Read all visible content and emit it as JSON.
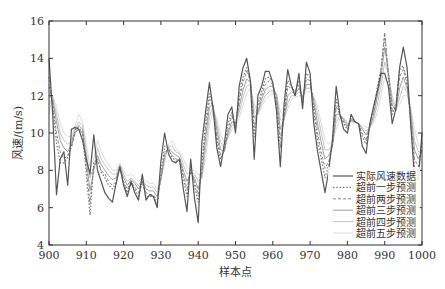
{
  "chart_data": {
    "type": "line",
    "title": "",
    "xlabel": "样本点",
    "ylabel": "风速/(m/s)",
    "xlim": [
      900,
      1000
    ],
    "ylim": [
      4,
      16
    ],
    "xticks": [
      900,
      910,
      920,
      930,
      940,
      950,
      960,
      970,
      980,
      990,
      1000
    ],
    "yticks": [
      4,
      6,
      8,
      10,
      12,
      14,
      16
    ],
    "grid": false,
    "legend_position": "lower right",
    "x": [
      900,
      901,
      902,
      903,
      904,
      905,
      906,
      907,
      908,
      909,
      910,
      911,
      912,
      913,
      914,
      915,
      916,
      917,
      918,
      919,
      920,
      921,
      922,
      923,
      924,
      925,
      926,
      927,
      928,
      929,
      930,
      931,
      932,
      933,
      934,
      935,
      936,
      937,
      938,
      939,
      940,
      941,
      942,
      943,
      944,
      945,
      946,
      947,
      948,
      949,
      950,
      951,
      952,
      953,
      954,
      955,
      956,
      957,
      958,
      959,
      960,
      961,
      962,
      963,
      964,
      965,
      966,
      967,
      968,
      969,
      970,
      971,
      972,
      973,
      974,
      975,
      976,
      977,
      978,
      979,
      980,
      981,
      982,
      983,
      984,
      985,
      986,
      987,
      988,
      989,
      990,
      991,
      992,
      993,
      994,
      995,
      996,
      997,
      998,
      999,
      1000
    ],
    "series": [
      {
        "name": "实际风速数据",
        "style": "solid",
        "color": "#555555",
        "width": 1.2,
        "values": [
          14.0,
          11.0,
          6.7,
          8.6,
          9.0,
          7.2,
          10.2,
          10.3,
          10.2,
          9.6,
          8.6,
          7.8,
          9.9,
          8.0,
          7.4,
          6.8,
          6.5,
          6.3,
          7.3,
          8.2,
          7.2,
          6.6,
          7.4,
          6.8,
          6.4,
          7.8,
          6.4,
          6.7,
          6.6,
          6.0,
          8.5,
          10.0,
          8.9,
          8.5,
          8.4,
          8.6,
          7.0,
          5.8,
          8.6,
          6.5,
          5.2,
          9.5,
          11.2,
          12.7,
          11.3,
          9.2,
          8.2,
          9.4,
          11.0,
          11.4,
          10.0,
          12.5,
          13.5,
          14.0,
          12.8,
          8.6,
          12.0,
          12.5,
          13.3,
          13.3,
          12.7,
          11.2,
          8.2,
          11.5,
          13.4,
          12.5,
          12.0,
          13.2,
          11.3,
          13.8,
          13.2,
          10.5,
          9.0,
          7.9,
          6.8,
          8.0,
          9.7,
          12.5,
          11.0,
          10.2,
          10.0,
          11.0,
          10.6,
          10.5,
          9.3,
          8.9,
          10.5,
          11.4,
          12.2,
          13.2,
          13.2,
          12.5,
          10.5,
          11.3,
          13.5,
          14.6,
          13.5,
          10.4,
          7.6,
          7.5,
          10.0
        ]
      },
      {
        "name": "超前一步预测",
        "style": "dotted",
        "color": "#777777",
        "width": 1.2,
        "values": [
          13.0,
          11.5,
          9.5,
          8.4,
          8.4,
          8.7,
          9.3,
          10.2,
          10.3,
          10.0,
          7.8,
          5.6,
          8.4,
          8.6,
          7.9,
          7.6,
          7.2,
          7.0,
          7.3,
          8.2,
          7.3,
          6.8,
          7.3,
          7.0,
          6.6,
          7.4,
          6.6,
          6.6,
          6.6,
          6.2,
          7.8,
          9.3,
          9.2,
          8.7,
          8.5,
          8.5,
          7.6,
          6.6,
          8.2,
          7.2,
          6.3,
          8.4,
          10.6,
          12.1,
          11.4,
          9.6,
          8.6,
          9.1,
          10.5,
          11.1,
          10.3,
          12.0,
          13.0,
          13.5,
          12.8,
          9.8,
          11.5,
          12.2,
          12.9,
          13.0,
          12.7,
          11.6,
          9.2,
          11.0,
          12.8,
          12.5,
          12.2,
          12.8,
          11.6,
          13.2,
          13.0,
          11.2,
          9.6,
          8.6,
          7.6,
          8.3,
          9.4,
          11.8,
          11.0,
          10.5,
          10.2,
          10.8,
          10.6,
          10.5,
          9.8,
          9.4,
          10.4,
          11.3,
          12.4,
          13.4,
          15.2,
          13.0,
          11.0,
          11.5,
          13.4,
          13.6,
          12.8,
          10.5,
          8.2,
          7.9,
          9.5
        ]
      },
      {
        "name": "超前两步预测",
        "style": "dashed",
        "color": "#888888",
        "width": 1.0,
        "values": [
          12.5,
          11.6,
          10.0,
          9.0,
          8.6,
          8.8,
          9.2,
          10.0,
          10.2,
          10.0,
          8.2,
          6.2,
          8.2,
          8.5,
          8.0,
          7.8,
          7.4,
          7.2,
          7.4,
          8.1,
          7.4,
          7.0,
          7.4,
          7.1,
          6.8,
          7.3,
          6.8,
          6.7,
          6.7,
          6.4,
          7.6,
          9.0,
          9.1,
          8.8,
          8.6,
          8.6,
          7.8,
          7.0,
          8.0,
          7.4,
          6.7,
          8.0,
          10.2,
          11.8,
          11.4,
          9.8,
          8.8,
          9.0,
          10.2,
          10.9,
          10.4,
          11.7,
          12.7,
          13.3,
          12.8,
          10.3,
          11.3,
          12.0,
          12.6,
          12.8,
          12.6,
          11.8,
          9.7,
          10.8,
          12.5,
          12.4,
          12.2,
          12.6,
          11.8,
          12.9,
          12.8,
          11.5,
          10.0,
          9.0,
          8.1,
          8.5,
          9.3,
          11.4,
          11.0,
          10.6,
          10.3,
          10.7,
          10.6,
          10.5,
          10.0,
          9.6,
          10.3,
          11.1,
          12.2,
          13.4,
          15.4,
          13.2,
          11.2,
          11.3,
          13.0,
          13.4,
          12.6,
          10.7,
          8.6,
          8.2,
          9.2
        ]
      },
      {
        "name": "超前三步预测",
        "style": "solid",
        "color": "#a0a0a0",
        "width": 1.0,
        "values": [
          12.0,
          11.8,
          10.6,
          9.6,
          9.2,
          9.0,
          9.4,
          10.0,
          10.4,
          10.2,
          8.6,
          6.9,
          8.0,
          8.8,
          8.3,
          8.0,
          7.7,
          7.5,
          7.6,
          8.2,
          7.6,
          7.2,
          7.5,
          7.3,
          7.0,
          7.4,
          7.0,
          6.9,
          6.9,
          6.6,
          7.5,
          8.8,
          9.2,
          9.0,
          8.8,
          8.7,
          8.0,
          7.4,
          7.9,
          7.6,
          7.0,
          7.8,
          9.8,
          11.4,
          11.5,
          10.2,
          9.1,
          9.0,
          10.0,
          10.6,
          10.5,
          11.4,
          12.3,
          12.9,
          12.7,
          10.8,
          11.1,
          11.8,
          12.3,
          12.5,
          12.5,
          12.0,
          10.2,
          10.7,
          12.0,
          12.2,
          12.1,
          12.4,
          11.9,
          12.6,
          12.6,
          11.7,
          10.5,
          9.5,
          8.6,
          8.8,
          9.3,
          11.0,
          11.0,
          10.7,
          10.4,
          10.7,
          10.6,
          10.5,
          10.2,
          9.9,
          10.3,
          10.9,
          11.9,
          13.0,
          14.6,
          13.3,
          11.5,
          11.2,
          12.4,
          13.0,
          12.4,
          11.0,
          9.1,
          8.6,
          9.0
        ]
      },
      {
        "name": "超前四步预测",
        "style": "solid",
        "color": "#c4c4c4",
        "width": 1.0,
        "values": [
          11.5,
          11.9,
          11.0,
          10.0,
          9.6,
          9.4,
          9.6,
          10.2,
          10.6,
          10.4,
          9.0,
          7.6,
          8.2,
          9.2,
          8.6,
          8.3,
          8.0,
          7.8,
          7.8,
          8.3,
          7.8,
          7.4,
          7.6,
          7.4,
          7.2,
          7.5,
          7.2,
          7.1,
          7.1,
          6.8,
          7.5,
          8.6,
          9.3,
          9.3,
          9.0,
          8.9,
          8.3,
          7.8,
          7.9,
          7.8,
          7.4,
          7.6,
          9.2,
          10.9,
          11.4,
          10.5,
          9.5,
          9.2,
          9.8,
          10.4,
          10.5,
          11.1,
          11.9,
          12.5,
          12.6,
          11.2,
          11.0,
          11.6,
          12.0,
          12.2,
          12.3,
          12.1,
          10.7,
          10.7,
          11.6,
          12.0,
          12.0,
          12.2,
          12.0,
          12.4,
          12.4,
          11.9,
          11.0,
          10.0,
          9.1,
          9.1,
          9.4,
          10.6,
          10.9,
          10.8,
          10.5,
          10.6,
          10.6,
          10.5,
          10.3,
          10.1,
          10.3,
          10.7,
          11.5,
          12.5,
          13.8,
          13.2,
          11.8,
          11.2,
          11.9,
          12.5,
          12.2,
          11.2,
          9.6,
          9.0,
          9.0
        ]
      },
      {
        "name": "超前五步预测",
        "style": "solid",
        "color": "#dcdcdc",
        "width": 1.0,
        "values": [
          11.0,
          12.0,
          11.4,
          10.5,
          10.0,
          9.8,
          9.8,
          10.4,
          11.0,
          10.6,
          9.4,
          8.2,
          8.6,
          9.6,
          9.0,
          8.6,
          8.3,
          8.0,
          8.0,
          8.4,
          8.0,
          7.7,
          7.8,
          7.6,
          7.4,
          7.6,
          7.4,
          7.3,
          7.3,
          7.0,
          7.5,
          8.4,
          9.4,
          9.6,
          9.2,
          9.0,
          8.6,
          8.2,
          8.0,
          8.0,
          7.8,
          7.6,
          8.6,
          10.4,
          11.2,
          10.8,
          9.9,
          9.5,
          9.7,
          10.2,
          10.4,
          10.8,
          11.5,
          12.1,
          12.4,
          11.6,
          11.0,
          11.4,
          11.8,
          12.0,
          12.1,
          12.1,
          11.2,
          10.8,
          11.3,
          11.8,
          11.9,
          12.0,
          12.0,
          12.2,
          12.2,
          12.0,
          11.4,
          10.5,
          9.6,
          9.4,
          9.6,
          10.2,
          10.8,
          10.8,
          10.6,
          10.6,
          10.6,
          10.5,
          10.4,
          10.3,
          10.3,
          10.5,
          11.1,
          12.0,
          13.0,
          13.0,
          12.0,
          11.3,
          11.5,
          12.0,
          12.0,
          11.4,
          10.2,
          9.4,
          9.0
        ]
      }
    ]
  }
}
